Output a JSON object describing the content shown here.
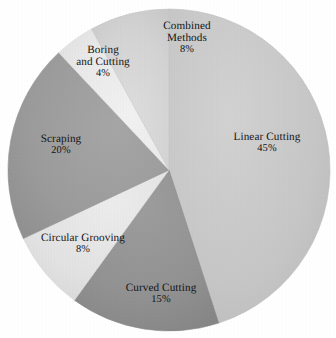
{
  "chart_data": {
    "type": "pie",
    "title": "",
    "subtitle": "",
    "xlabel": "",
    "ylabel": "",
    "legend_position": "none",
    "grid": false,
    "labels_on_slices": true,
    "start_angle_deg": 0,
    "direction": "clockwise",
    "categories": [
      "Linear Cutting",
      "Curved Cutting",
      "Circular Grooving",
      "Scraping",
      "Boring and Cutting",
      "Combined Methods"
    ],
    "values": [
      45,
      15,
      8,
      20,
      4,
      8
    ],
    "value_labels": [
      "45%",
      "15%",
      "8%",
      "20%",
      "4%",
      "8%"
    ],
    "units": "percent",
    "total": 100,
    "slices": [
      {
        "name": "Linear Cutting",
        "name_line1": "Linear Cutting",
        "name_line2": "",
        "value": 45,
        "value_label": "45%",
        "color": "#c6c6c6",
        "color_edge": "#b6b6b6",
        "start_deg": 0,
        "end_deg": 162
      },
      {
        "name": "Curved Cutting",
        "name_line1": "Curved Cutting",
        "name_line2": "",
        "value": 15,
        "value_label": "15%",
        "color": "#929292",
        "color_edge": "#848484",
        "start_deg": 162,
        "end_deg": 216
      },
      {
        "name": "Circular Grooving",
        "name_line1": "Circular Grooving",
        "name_line2": "",
        "value": 8,
        "value_label": "8%",
        "color": "#e2e2e2",
        "color_edge": "#d4d4d4",
        "start_deg": 216,
        "end_deg": 244.8
      },
      {
        "name": "Scraping",
        "name_line1": "Scraping",
        "name_line2": "",
        "value": 20,
        "value_label": "20%",
        "color": "#9b9b9b",
        "color_edge": "#8d8d8d",
        "start_deg": 244.8,
        "end_deg": 316.8
      },
      {
        "name": "Boring and Cutting",
        "name_line1": "Boring",
        "name_line2": "and Cutting",
        "value": 4,
        "value_label": "4%",
        "color": "#e9e9e9",
        "color_edge": "#dcdcdc",
        "start_deg": 316.8,
        "end_deg": 331.2
      },
      {
        "name": "Combined Methods",
        "name_line1": "Combined",
        "name_line2": "Methods",
        "value": 8,
        "value_label": "8%",
        "color": "#d3d3d3",
        "color_edge": "#c4c4c4",
        "start_deg": 331.2,
        "end_deg": 360
      }
    ],
    "geometry": {
      "center_x": 169,
      "center_y": 170,
      "radius": 161
    },
    "background_color": "#ffffff",
    "text_color": "#141414"
  }
}
